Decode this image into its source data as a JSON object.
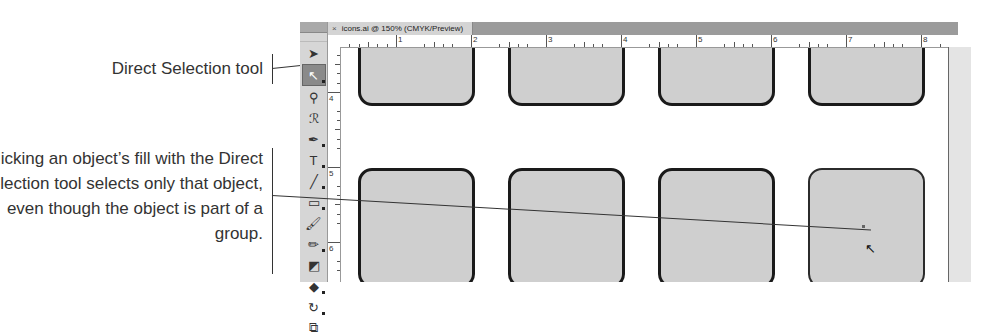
{
  "callouts": [
    {
      "id": "direct-selection",
      "text": "Direct Selection tool"
    },
    {
      "id": "fill-click",
      "text": "Clicking an object’s fill with the Direct Selection tool selects only that object, even though the object is part of a group."
    }
  ],
  "document": {
    "tab_title": "icons.ai @ 150% (CMYK/Preview)",
    "close_glyph": "×"
  },
  "rulers": {
    "horizontal": [
      "1",
      "2",
      "3",
      "4",
      "5",
      "6",
      "7",
      "8"
    ],
    "vertical": [
      "4",
      "5",
      "6"
    ]
  },
  "tools": [
    {
      "name": "selection-tool",
      "glyph": "➤"
    },
    {
      "name": "direct-selection-tool",
      "glyph": "↖",
      "active": true
    },
    {
      "name": "magic-wand-tool",
      "glyph": "⚲"
    },
    {
      "name": "lasso-tool",
      "glyph": "ℛ"
    },
    {
      "name": "pen-tool",
      "glyph": "✒"
    },
    {
      "name": "type-tool",
      "glyph": "T"
    },
    {
      "name": "line-segment-tool",
      "glyph": "╱"
    },
    {
      "name": "rectangle-tool",
      "glyph": "▭"
    },
    {
      "name": "paintbrush-tool",
      "glyph": "🖌"
    },
    {
      "name": "pencil-tool",
      "glyph": "✏"
    },
    {
      "name": "blob-brush-tool",
      "glyph": "◩"
    },
    {
      "name": "eraser-tool",
      "glyph": "◆"
    },
    {
      "name": "rotate-tool",
      "glyph": "↻"
    },
    {
      "name": "scale-tool",
      "glyph": "⧉"
    }
  ]
}
